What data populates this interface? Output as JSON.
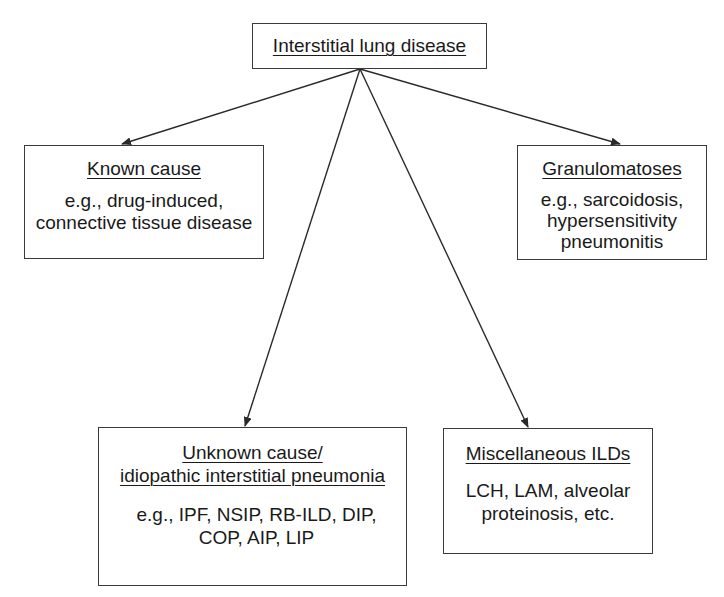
{
  "diagram": {
    "colors": {
      "line": "#2a2a2a",
      "box_border": "#3a3a3a",
      "text": "#1a1a1a",
      "background": "#ffffff"
    },
    "nodes": {
      "root": {
        "title": "Interstitial lung disease"
      },
      "known": {
        "title": "Known cause",
        "body": "e.g., drug-induced,\nconnective tissue disease"
      },
      "granulomatoses": {
        "title": "Granulomatoses",
        "body": "e.g., sarcoidosis,\nhypersensitivity\npneumonitis"
      },
      "unknown": {
        "title_line1": "Unknown cause/",
        "title_line2": "idiopathic interstitial pneumonia",
        "body": "e.g., IPF, NSIP, RB-ILD, DIP,\nCOP, AIP, LIP"
      },
      "misc": {
        "title": "Miscellaneous ILDs",
        "body": "LCH, LAM, alveolar\nproteinosis, etc."
      }
    },
    "edges": [
      {
        "from": "root",
        "to": "known"
      },
      {
        "from": "root",
        "to": "granulomatoses"
      },
      {
        "from": "root",
        "to": "unknown"
      },
      {
        "from": "root",
        "to": "misc"
      }
    ]
  }
}
